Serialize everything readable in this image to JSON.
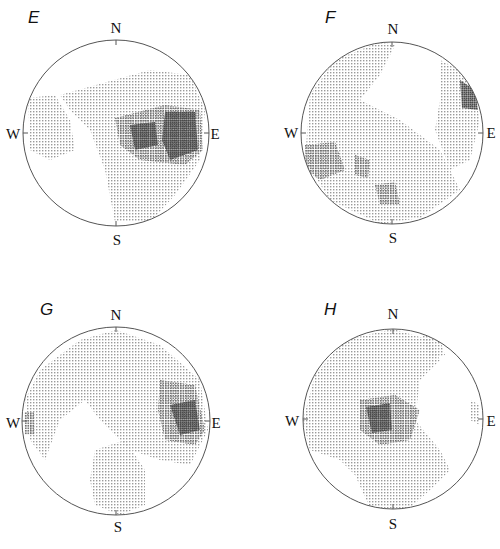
{
  "figure": {
    "panels": [
      {
        "label": "E",
        "center": [
          116,
          133
        ],
        "radius": 93,
        "label_pos": [
          38,
          8
        ],
        "cardinals": {
          "N": "N",
          "S": "S",
          "W": "W",
          "E": "E"
        },
        "density_regions": [
          {
            "level": 1,
            "shape": "M60,95 L150,70 L190,75 L205,110 L200,160 L175,195 L150,222 L115,222 L105,170 L90,130 L70,110 Z"
          },
          {
            "level": 1,
            "shape": "M28,98 L55,95 L70,120 L75,150 L50,160 L30,150 Z"
          },
          {
            "level": 2,
            "shape": "M115,118 L165,105 L200,110 L203,150 L185,165 L140,160 L120,145 Z"
          },
          {
            "level": 3,
            "shape": "M165,112 L195,112 L198,150 L170,160 L162,140 Z"
          },
          {
            "level": 3,
            "shape": "M130,125 L155,122 L158,145 L135,150 Z"
          }
        ]
      },
      {
        "label": "F",
        "center": [
          392,
          133
        ],
        "radius": 91,
        "label_pos": [
          325,
          8
        ],
        "cardinals": {
          "N": "N",
          "S": "S",
          "W": "W",
          "E": "E"
        },
        "density_regions": [
          {
            "level": 1,
            "shape": "M310,95 L335,60 L380,42 L395,45 L380,75 L360,100 L400,120 L440,150 L460,190 L420,218 L380,224 L330,200 L305,160 Z"
          },
          {
            "level": 1,
            "shape": "M440,60 L470,75 L480,120 L470,160 L450,170 L435,130 L440,100 Z"
          },
          {
            "level": 2,
            "shape": "M305,145 L335,142 L345,170 L320,180 L306,170 Z"
          },
          {
            "level": 2,
            "shape": "M375,185 L395,182 L400,205 L380,205 Z"
          },
          {
            "level": 3,
            "shape": "M460,80 L475,90 L478,110 L462,108 Z"
          },
          {
            "level": 2,
            "shape": "M355,155 L370,160 L368,178 L355,175 Z"
          }
        ]
      },
      {
        "label": "G",
        "center": [
          116,
          421
        ],
        "radius": 94,
        "label_pos": [
          40,
          300
        ],
        "cardinals": {
          "N": "N",
          "S": "S",
          "W": "W",
          "E": "E"
        },
        "density_regions": [
          {
            "level": 1,
            "shape": "M40,370 L80,340 L116,330 L160,345 L200,380 L208,430 L190,465 L160,460 L130,450 L100,420 L85,400 L60,420 L45,460 L30,440 L25,400 Z"
          },
          {
            "level": 1,
            "shape": "M95,450 L125,440 L145,470 L145,505 L120,515 L95,505 L90,480 Z"
          },
          {
            "level": 2,
            "shape": "M160,380 L195,385 L205,430 L195,445 L165,440 L158,410 Z"
          },
          {
            "level": 3,
            "shape": "M170,405 L195,400 L200,430 L180,435 Z"
          },
          {
            "level": 2,
            "shape": "M24,412 L34,412 L35,435 L25,435 Z"
          }
        ]
      },
      {
        "label": "H",
        "center": [
          393,
          419
        ],
        "radius": 90,
        "label_pos": [
          324,
          300
        ],
        "cardinals": {
          "N": "N",
          "S": "S",
          "W": "W",
          "E": "E"
        },
        "density_regions": [
          {
            "level": 1,
            "shape": "M315,375 L345,340 L393,329 L430,340 L440,360 L420,380 L415,420 L440,450 L450,470 L430,490 L410,508 L370,508 L355,475 L340,460 L310,450 L303,420 Z"
          },
          {
            "level": 1,
            "shape": "M420,330 L440,340 L445,355 L430,358 Z"
          },
          {
            "level": 1,
            "shape": "M470,400 L480,405 L480,425 L470,420 Z"
          },
          {
            "level": 2,
            "shape": "M360,400 L395,395 L420,410 L410,440 L380,445 L360,430 Z"
          },
          {
            "level": 3,
            "shape": "M366,407 L390,403 L392,430 L372,433 Z"
          }
        ]
      }
    ],
    "colors": {
      "outline": "#555555",
      "level_1": "#d9d9d9",
      "level_2": "#b3b3b3",
      "level_3": "#8a8a8a",
      "text": "#111111"
    }
  }
}
